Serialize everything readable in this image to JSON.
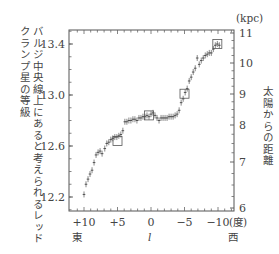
{
  "chart_data": {
    "type": "scatter",
    "title": "",
    "xlabel": "l",
    "xunit": "(度)",
    "x_direction_labels": {
      "left": "東",
      "right": "西"
    },
    "ylabel_left_lines": [
      "バルジ中央線上にあると考えられるレッド",
      "クランプ星の等級"
    ],
    "ylabel_right": "太陽からの距離",
    "yunit_right": "(kpc)",
    "xlim": [
      11.5,
      -12.5
    ],
    "ylim_left": [
      12.1,
      13.5
    ],
    "x_ticks": [
      {
        "v": 10,
        "label": "+10"
      },
      {
        "v": 5,
        "label": "+5"
      },
      {
        "v": 0,
        "label": "0"
      },
      {
        "v": -5,
        "label": "−5"
      },
      {
        "v": -10,
        "label": "−10"
      }
    ],
    "y_ticks_left": [
      {
        "v": 13.4,
        "label": "13.4"
      },
      {
        "v": 13.0,
        "label": "13.0"
      },
      {
        "v": 12.6,
        "label": "12.6"
      },
      {
        "v": 12.2,
        "label": "12.2"
      }
    ],
    "y_ticks_right": [
      {
        "label": "11",
        "mag": 13.52
      },
      {
        "label": "10",
        "mag": 13.29
      },
      {
        "label": "9",
        "mag": 13.04
      },
      {
        "label": "8",
        "mag": 12.79
      },
      {
        "label": "7",
        "mag": 12.5
      },
      {
        "label": "6",
        "mag": 12.14
      }
    ],
    "grid": false,
    "legend": null,
    "series": [
      {
        "name": "red clump magnitude",
        "points": [
          {
            "x": 10.0,
            "y": 12.22
          },
          {
            "x": 9.7,
            "y": 12.3
          },
          {
            "x": 9.4,
            "y": 12.34
          },
          {
            "x": 9.1,
            "y": 12.38
          },
          {
            "x": 8.8,
            "y": 12.41
          },
          {
            "x": 8.5,
            "y": 12.47
          },
          {
            "x": 8.2,
            "y": 12.53
          },
          {
            "x": 7.9,
            "y": 12.55
          },
          {
            "x": 7.6,
            "y": 12.56
          },
          {
            "x": 7.3,
            "y": 12.54
          },
          {
            "x": 6.9,
            "y": 12.58
          },
          {
            "x": 6.6,
            "y": 12.62
          },
          {
            "x": 6.3,
            "y": 12.63
          },
          {
            "x": 6.0,
            "y": 12.65
          },
          {
            "x": 5.7,
            "y": 12.66
          },
          {
            "x": 5.4,
            "y": 12.67
          },
          {
            "x": 5.1,
            "y": 12.67
          },
          {
            "x": 4.8,
            "y": 12.68
          },
          {
            "x": 4.5,
            "y": 12.69
          },
          {
            "x": 4.2,
            "y": 12.72
          },
          {
            "x": 3.9,
            "y": 12.79
          },
          {
            "x": 3.6,
            "y": 12.79
          },
          {
            "x": 3.3,
            "y": 12.8
          },
          {
            "x": 3.0,
            "y": 12.8
          },
          {
            "x": 2.7,
            "y": 12.81
          },
          {
            "x": 2.4,
            "y": 12.81
          },
          {
            "x": 2.1,
            "y": 12.8
          },
          {
            "x": 1.8,
            "y": 12.82
          },
          {
            "x": 1.5,
            "y": 12.82
          },
          {
            "x": 1.2,
            "y": 12.83
          },
          {
            "x": 0.9,
            "y": 12.83
          },
          {
            "x": 0.6,
            "y": 12.84
          },
          {
            "x": 0.3,
            "y": 12.83
          },
          {
            "x": 0.0,
            "y": 12.85
          },
          {
            "x": -0.3,
            "y": 12.86
          },
          {
            "x": -0.6,
            "y": 12.84
          },
          {
            "x": -0.9,
            "y": 12.82
          },
          {
            "x": -1.2,
            "y": 12.8
          },
          {
            "x": -1.5,
            "y": 12.82
          },
          {
            "x": -1.8,
            "y": 12.82
          },
          {
            "x": -2.1,
            "y": 12.82
          },
          {
            "x": -2.4,
            "y": 12.82
          },
          {
            "x": -2.7,
            "y": 12.83
          },
          {
            "x": -3.0,
            "y": 12.83
          },
          {
            "x": -3.3,
            "y": 12.83
          },
          {
            "x": -3.6,
            "y": 12.84
          },
          {
            "x": -3.9,
            "y": 12.85
          },
          {
            "x": -4.2,
            "y": 12.88
          },
          {
            "x": -4.5,
            "y": 12.94
          },
          {
            "x": -4.8,
            "y": 12.97
          },
          {
            "x": -5.1,
            "y": 13.02
          },
          {
            "x": -5.4,
            "y": 13.05
          },
          {
            "x": -5.7,
            "y": 13.11
          },
          {
            "x": -6.0,
            "y": 13.14
          },
          {
            "x": -6.3,
            "y": 13.18
          },
          {
            "x": -6.6,
            "y": 13.21
          },
          {
            "x": -6.9,
            "y": 13.29
          },
          {
            "x": -7.2,
            "y": 13.24
          },
          {
            "x": -7.5,
            "y": 13.27
          },
          {
            "x": -7.8,
            "y": 13.29
          },
          {
            "x": -8.1,
            "y": 13.31
          },
          {
            "x": -8.4,
            "y": 13.32
          },
          {
            "x": -8.7,
            "y": 13.33
          },
          {
            "x": -9.0,
            "y": 13.33
          },
          {
            "x": -9.3,
            "y": 13.36
          },
          {
            "x": -9.6,
            "y": 13.39
          },
          {
            "x": -9.9,
            "y": 13.4
          },
          {
            "x": -10.2,
            "y": 13.39
          }
        ]
      }
    ],
    "highlight_boxes": [
      {
        "x": 5.0,
        "y": 12.64
      },
      {
        "x": 0.3,
        "y": 12.84
      },
      {
        "x": -5.0,
        "y": 13.01
      },
      {
        "x": -9.9,
        "y": 13.4
      }
    ]
  }
}
